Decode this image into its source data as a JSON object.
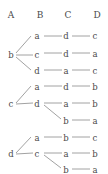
{
  "diagram": {
    "type": "tree",
    "title": "",
    "columns": [
      {
        "id": "A",
        "label": "A",
        "x": 11
      },
      {
        "id": "B",
        "label": "B",
        "x": 40
      },
      {
        "id": "C",
        "label": "C",
        "x": 68
      },
      {
        "id": "D",
        "label": "D",
        "x": 97
      }
    ],
    "header_y": 18,
    "colors": {
      "text": "#4a4a4a",
      "edge": "#a2a2a2",
      "background": "#ffffff"
    },
    "rows": [
      {
        "index": 0,
        "y": 38,
        "A": "",
        "B": "a",
        "C": "d",
        "D": "c"
      },
      {
        "index": 1,
        "y": 55,
        "A": "b",
        "B": "c",
        "C": "d",
        "D": "a"
      },
      {
        "index": 2,
        "y": 72,
        "A": "",
        "B": "d",
        "C": "a",
        "D": "c"
      },
      {
        "index": 3,
        "y": 88,
        "A": "",
        "B": "a",
        "C": "d",
        "D": "b"
      },
      {
        "index": 4,
        "y": 105,
        "A": "c",
        "B": "d",
        "C": "a",
        "D": "b"
      },
      {
        "index": 5,
        "y": 122,
        "A": "",
        "B": "",
        "C": "b",
        "D": "a"
      },
      {
        "index": 6,
        "y": 139,
        "A": "",
        "B": "a",
        "C": "b",
        "D": "c"
      },
      {
        "index": 7,
        "y": 155,
        "A": "d",
        "B": "c",
        "C": "a",
        "D": "b"
      },
      {
        "index": 8,
        "y": 170,
        "A": "",
        "B": "",
        "C": "b",
        "D": "a"
      }
    ],
    "paths": [
      [
        "b",
        "a",
        "d",
        "c"
      ],
      [
        "b",
        "c",
        "d",
        "a"
      ],
      [
        "b",
        "d",
        "a",
        "c"
      ],
      [
        "c",
        "a",
        "d",
        "b"
      ],
      [
        "c",
        "d",
        "a",
        "b"
      ],
      [
        "c",
        "d",
        "b",
        "a"
      ],
      [
        "d",
        "a",
        "b",
        "c"
      ],
      [
        "d",
        "c",
        "a",
        "b"
      ],
      [
        "d",
        "c",
        "b",
        "a"
      ]
    ],
    "edges": [
      {
        "name": "edge-b-to-a",
        "x1": 16,
        "y1": 53,
        "x2": 31,
        "y2": 36
      },
      {
        "name": "edge-b-to-c",
        "x1": 16,
        "y1": 55,
        "x2": 33,
        "y2": 55
      },
      {
        "name": "edge-b-to-d",
        "x1": 16,
        "y1": 57,
        "x2": 31,
        "y2": 70
      },
      {
        "name": "edge-b1-c",
        "x1": 44,
        "y1": 36,
        "x2": 62,
        "y2": 36
      },
      {
        "name": "edge-b2-c",
        "x1": 44,
        "y1": 53,
        "x2": 62,
        "y2": 53
      },
      {
        "name": "edge-b3-c",
        "x1": 44,
        "y1": 70,
        "x2": 62,
        "y2": 70
      },
      {
        "name": "edge-c1-d",
        "x1": 72,
        "y1": 36,
        "x2": 90,
        "y2": 36
      },
      {
        "name": "edge-c2-d",
        "x1": 72,
        "y1": 53,
        "x2": 90,
        "y2": 53
      },
      {
        "name": "edge-c3-d",
        "x1": 72,
        "y1": 70,
        "x2": 90,
        "y2": 70
      },
      {
        "name": "edge-c-to-a",
        "x1": 16,
        "y1": 103,
        "x2": 31,
        "y2": 86
      },
      {
        "name": "edge-c-to-d",
        "x1": 16,
        "y1": 104,
        "x2": 33,
        "y2": 103
      },
      {
        "name": "edge-b4-c",
        "x1": 44,
        "y1": 86,
        "x2": 62,
        "y2": 86
      },
      {
        "name": "edge-b5-c",
        "x1": 44,
        "y1": 103,
        "x2": 62,
        "y2": 103
      },
      {
        "name": "edge-d-to-b",
        "x1": 44,
        "y1": 105,
        "x2": 61,
        "y2": 119
      },
      {
        "name": "edge-c4-d",
        "x1": 72,
        "y1": 86,
        "x2": 90,
        "y2": 86
      },
      {
        "name": "edge-c5-d",
        "x1": 72,
        "y1": 103,
        "x2": 90,
        "y2": 103
      },
      {
        "name": "edge-c6-d",
        "x1": 72,
        "y1": 120,
        "x2": 90,
        "y2": 120
      },
      {
        "name": "edge-d-to-a",
        "x1": 16,
        "y1": 153,
        "x2": 31,
        "y2": 137
      },
      {
        "name": "edge-d-to-c",
        "x1": 16,
        "y1": 154,
        "x2": 33,
        "y2": 153
      },
      {
        "name": "edge-b6-c",
        "x1": 44,
        "y1": 137,
        "x2": 62,
        "y2": 137
      },
      {
        "name": "edge-b7-c",
        "x1": 44,
        "y1": 153,
        "x2": 62,
        "y2": 153
      },
      {
        "name": "edge-c-to-b2",
        "x1": 44,
        "y1": 155,
        "x2": 61,
        "y2": 168
      },
      {
        "name": "edge-c7-d",
        "x1": 72,
        "y1": 137,
        "x2": 90,
        "y2": 137
      },
      {
        "name": "edge-c8-d",
        "x1": 72,
        "y1": 153,
        "x2": 90,
        "y2": 153
      },
      {
        "name": "edge-c9-d",
        "x1": 72,
        "y1": 169,
        "x2": 90,
        "y2": 169
      }
    ],
    "nodes": [
      {
        "name": "node-A-b",
        "col": "A",
        "label": "b",
        "x": 11,
        "y": 58
      },
      {
        "name": "node-A-c",
        "col": "A",
        "label": "c",
        "x": 11,
        "y": 107
      },
      {
        "name": "node-A-d",
        "col": "A",
        "label": "d",
        "x": 11,
        "y": 157
      },
      {
        "name": "node-B-r0",
        "col": "B",
        "label": "a",
        "x": 37,
        "y": 39
      },
      {
        "name": "node-B-r1",
        "col": "B",
        "label": "c",
        "x": 37,
        "y": 58
      },
      {
        "name": "node-B-r2",
        "col": "B",
        "label": "d",
        "x": 37,
        "y": 74
      },
      {
        "name": "node-B-r3",
        "col": "B",
        "label": "a",
        "x": 37,
        "y": 90
      },
      {
        "name": "node-B-r4",
        "col": "B",
        "label": "d",
        "x": 37,
        "y": 107
      },
      {
        "name": "node-B-r6",
        "col": "B",
        "label": "a",
        "x": 37,
        "y": 141
      },
      {
        "name": "node-B-r7",
        "col": "B",
        "label": "c",
        "x": 37,
        "y": 157
      },
      {
        "name": "node-C-r0",
        "col": "C",
        "label": "d",
        "x": 66,
        "y": 39
      },
      {
        "name": "node-C-r1",
        "col": "C",
        "label": "d",
        "x": 66,
        "y": 57
      },
      {
        "name": "node-C-r2",
        "col": "C",
        "label": "a",
        "x": 66,
        "y": 74
      },
      {
        "name": "node-C-r3",
        "col": "C",
        "label": "d",
        "x": 66,
        "y": 90
      },
      {
        "name": "node-C-r4",
        "col": "C",
        "label": "a",
        "x": 66,
        "y": 107
      },
      {
        "name": "node-C-r5",
        "col": "C",
        "label": "b",
        "x": 66,
        "y": 124
      },
      {
        "name": "node-C-r6",
        "col": "C",
        "label": "b",
        "x": 66,
        "y": 141
      },
      {
        "name": "node-C-r7",
        "col": "C",
        "label": "a",
        "x": 66,
        "y": 157
      },
      {
        "name": "node-C-r8",
        "col": "C",
        "label": "b",
        "x": 66,
        "y": 173
      },
      {
        "name": "node-D-r0",
        "col": "D",
        "label": "c",
        "x": 95,
        "y": 39
      },
      {
        "name": "node-D-r1",
        "col": "D",
        "label": "a",
        "x": 95,
        "y": 57
      },
      {
        "name": "node-D-r2",
        "col": "D",
        "label": "c",
        "x": 95,
        "y": 74
      },
      {
        "name": "node-D-r3",
        "col": "D",
        "label": "b",
        "x": 95,
        "y": 90
      },
      {
        "name": "node-D-r4",
        "col": "D",
        "label": "b",
        "x": 95,
        "y": 107
      },
      {
        "name": "node-D-r5",
        "col": "D",
        "label": "a",
        "x": 95,
        "y": 124
      },
      {
        "name": "node-D-r6",
        "col": "D",
        "label": "c",
        "x": 95,
        "y": 141
      },
      {
        "name": "node-D-r7",
        "col": "D",
        "label": "b",
        "x": 95,
        "y": 157
      },
      {
        "name": "node-D-r8",
        "col": "D",
        "label": "a",
        "x": 95,
        "y": 173
      }
    ]
  }
}
